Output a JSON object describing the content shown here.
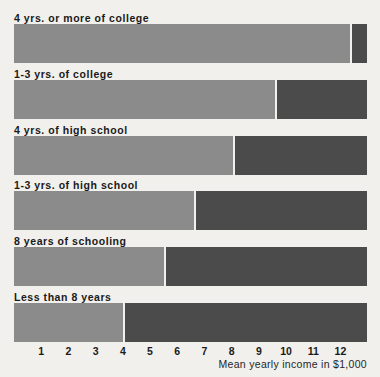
{
  "chart_data": {
    "type": "bar",
    "title": "",
    "subtitle": "",
    "xlabel": "Mean yearly income in $1,000",
    "ylabel": "",
    "orientation": "horizontal",
    "grid": false,
    "legend": "none",
    "xlim": [
      0,
      13
    ],
    "xticks": [
      1,
      2,
      3,
      4,
      5,
      6,
      7,
      8,
      9,
      10,
      11,
      12
    ],
    "xtick_labels": [
      "1",
      "2",
      "3",
      "4",
      "5",
      "6",
      "7",
      "8",
      "9",
      "10",
      "11",
      "12"
    ],
    "categories": [
      "4 yrs. or more of college",
      "1-3 yrs. of college",
      "4 yrs. of high school",
      "1-3 yrs. of high school",
      "8 years of schooling",
      "Less than 8 years"
    ],
    "values": [
      12.35,
      9.6,
      8.05,
      6.6,
      5.5,
      4.0
    ],
    "bar_fill_color": "#8b8b8b",
    "track_color": "#4b4b4b",
    "background_color": "#f1f0ec",
    "text_color": "#1a1a1a"
  },
  "axis": {
    "caption": "Mean yearly income in $1,000"
  },
  "rows": [
    {
      "label": "4 yrs. or more of college",
      "value": 12.35
    },
    {
      "label": "1-3 yrs. of college",
      "value": 9.6
    },
    {
      "label": "4 yrs. of high school",
      "value": 8.05
    },
    {
      "label": "1-3 yrs. of high school",
      "value": 6.6
    },
    {
      "label": "8 years of schooling",
      "value": 5.5
    },
    {
      "label": "Less than 8 years",
      "value": 4.0
    }
  ]
}
